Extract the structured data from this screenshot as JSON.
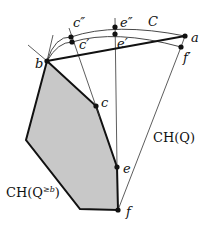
{
  "labels": {
    "a": "a",
    "b": "b",
    "c": "c",
    "c_prime": "c′",
    "c_double_prime": "c″",
    "e": "e",
    "e_prime": "e′",
    "e_double_prime": "e″",
    "f": "f",
    "f_prime": "f′",
    "C": "C",
    "ch_q": "CH(Q)",
    "ch_q_geb_prefix": "CH(Q",
    "ch_q_geb_sup": "≥b",
    "ch_q_geb_suffix": ")"
  },
  "colors": {
    "fill": "#c8c8c8",
    "stroke": "#111111",
    "thin": "#333333"
  }
}
